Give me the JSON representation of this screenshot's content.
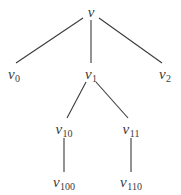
{
  "diagram": {
    "type": "tree",
    "line_color": "#3a3a3a",
    "text_color": "#3a3a3a",
    "nodes": [
      {
        "id": "v",
        "base": "v",
        "sub": "",
        "x": 91,
        "y": 12
      },
      {
        "id": "v0",
        "base": "v",
        "sub": "0",
        "x": 14,
        "y": 74
      },
      {
        "id": "v1",
        "base": "v",
        "sub": "1",
        "x": 91,
        "y": 74
      },
      {
        "id": "v2",
        "base": "v",
        "sub": "2",
        "x": 165,
        "y": 74
      },
      {
        "id": "v10",
        "base": "v",
        "sub": "10",
        "x": 64,
        "y": 129
      },
      {
        "id": "v11",
        "base": "v",
        "sub": "11",
        "x": 131,
        "y": 129
      },
      {
        "id": "v100",
        "base": "v",
        "sub": "100",
        "x": 64,
        "y": 182
      },
      {
        "id": "v110",
        "base": "v",
        "sub": "110",
        "x": 131,
        "y": 182
      }
    ],
    "edges": [
      {
        "from": "v",
        "to": "v0",
        "x1": 83,
        "y1": 18,
        "x2": 16,
        "y2": 63
      },
      {
        "from": "v",
        "to": "v1",
        "x1": 91,
        "y1": 20,
        "x2": 91,
        "y2": 63
      },
      {
        "from": "v",
        "to": "v2",
        "x1": 99,
        "y1": 18,
        "x2": 162,
        "y2": 63
      },
      {
        "from": "v1",
        "to": "v10",
        "x1": 86,
        "y1": 82,
        "x2": 67,
        "y2": 118
      },
      {
        "from": "v1",
        "to": "v11",
        "x1": 96,
        "y1": 82,
        "x2": 128,
        "y2": 118
      },
      {
        "from": "v10",
        "to": "v100",
        "x1": 64,
        "y1": 138,
        "x2": 64,
        "y2": 172
      },
      {
        "from": "v11",
        "to": "v110",
        "x1": 131,
        "y1": 138,
        "x2": 131,
        "y2": 172
      }
    ]
  }
}
